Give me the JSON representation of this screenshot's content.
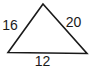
{
  "diagram": {
    "type": "triangle",
    "stroke_color": "#1a1a1a",
    "fill_color": "#ffffff",
    "vertices": {
      "apex": [
        43,
        4
      ],
      "bottom_left": [
        8,
        52.5
      ],
      "bottom_right": [
        87,
        53.5
      ]
    },
    "sides": {
      "left": {
        "label": "16"
      },
      "right": {
        "label": "20"
      },
      "bottom": {
        "label": "12"
      }
    }
  }
}
